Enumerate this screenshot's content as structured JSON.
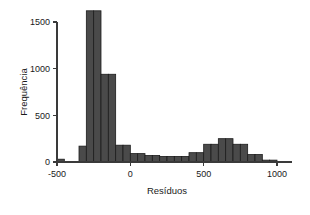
{
  "chart_data": {
    "type": "bar",
    "subtype": "histogram",
    "title": "",
    "xlabel": "Resíduos",
    "ylabel": "Frequência",
    "xlim": [
      -500,
      1100
    ],
    "ylim": [
      0,
      1650
    ],
    "bin_width": 50,
    "grid": false,
    "legend": null,
    "bar_color": "#4a4a4a",
    "bar_edge_color": "#1c1c1c",
    "axis_color": "#3a3a3a",
    "background_color": "#ffffff",
    "xticks": [
      -500,
      0,
      500,
      1000
    ],
    "xtick_labels": [
      "-500",
      "0",
      "500",
      "1000"
    ],
    "yticks": [
      0,
      500,
      1000,
      1500
    ],
    "ytick_labels": [
      "0",
      "500",
      "1000",
      "1500"
    ],
    "bins": [
      {
        "x0": -500,
        "x1": -450,
        "value": 30
      },
      {
        "x0": -450,
        "x1": -400,
        "value": 0
      },
      {
        "x0": -400,
        "x1": -350,
        "value": 0
      },
      {
        "x0": -350,
        "x1": -300,
        "value": 170
      },
      {
        "x0": -300,
        "x1": -250,
        "value": 1620
      },
      {
        "x0": -250,
        "x1": -200,
        "value": 1620
      },
      {
        "x0": -200,
        "x1": -150,
        "value": 940
      },
      {
        "x0": -150,
        "x1": -100,
        "value": 940
      },
      {
        "x0": -100,
        "x1": -50,
        "value": 180
      },
      {
        "x0": -50,
        "x1": 0,
        "value": 180
      },
      {
        "x0": 0,
        "x1": 50,
        "value": 90
      },
      {
        "x0": 50,
        "x1": 100,
        "value": 90
      },
      {
        "x0": 100,
        "x1": 150,
        "value": 70
      },
      {
        "x0": 150,
        "x1": 200,
        "value": 70
      },
      {
        "x0": 200,
        "x1": 250,
        "value": 60
      },
      {
        "x0": 250,
        "x1": 300,
        "value": 60
      },
      {
        "x0": 300,
        "x1": 350,
        "value": 60
      },
      {
        "x0": 350,
        "x1": 400,
        "value": 60
      },
      {
        "x0": 400,
        "x1": 450,
        "value": 100
      },
      {
        "x0": 450,
        "x1": 500,
        "value": 100
      },
      {
        "x0": 500,
        "x1": 550,
        "value": 190
      },
      {
        "x0": 550,
        "x1": 600,
        "value": 190
      },
      {
        "x0": 600,
        "x1": 650,
        "value": 250
      },
      {
        "x0": 650,
        "x1": 700,
        "value": 250
      },
      {
        "x0": 700,
        "x1": 750,
        "value": 190
      },
      {
        "x0": 750,
        "x1": 800,
        "value": 190
      },
      {
        "x0": 800,
        "x1": 850,
        "value": 80
      },
      {
        "x0": 850,
        "x1": 900,
        "value": 80
      },
      {
        "x0": 900,
        "x1": 950,
        "value": 20
      },
      {
        "x0": 950,
        "x1": 1000,
        "value": 20
      }
    ]
  }
}
